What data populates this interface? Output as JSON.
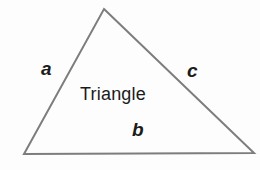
{
  "figure": {
    "name": "triangle-diagram",
    "width": 260,
    "height": 170,
    "background_color": "#fdfdfd",
    "stroke_color": "#7d7d7d",
    "stroke_width": 2,
    "text_color": "#1b1b1b",
    "interior_label": "Triangle",
    "vertices": {
      "apex": {
        "x": 104,
        "y": 9
      },
      "bottom_left": {
        "x": 24,
        "y": 154
      },
      "bottom_right": {
        "x": 254,
        "y": 153
      }
    },
    "sides": [
      {
        "id": "a",
        "label": "a",
        "description": "left side from bottom-left vertex to apex",
        "from": "bottom_left",
        "to": "apex"
      },
      {
        "id": "b",
        "label": "b",
        "description": "bottom side from bottom-left vertex to bottom-right vertex",
        "from": "bottom_left",
        "to": "bottom_right"
      },
      {
        "id": "c",
        "label": "c",
        "description": "right side from apex to bottom-right vertex",
        "from": "apex",
        "to": "bottom_right"
      }
    ]
  }
}
